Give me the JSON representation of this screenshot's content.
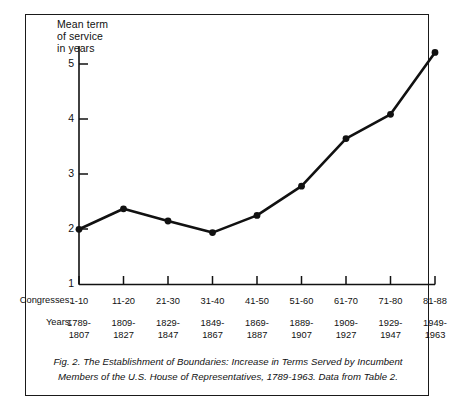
{
  "chart_data": {
    "type": "line",
    "title": "",
    "ylabel": "Mean term\nof service\nin years",
    "xlabel": "",
    "ylim": [
      1,
      5.6
    ],
    "yticks": [
      1,
      2,
      3,
      4,
      5
    ],
    "ytick_labels": [
      "1",
      "2",
      "3",
      "4",
      "5"
    ],
    "grid": false,
    "legend": null,
    "categories": [
      "1-10",
      "11-20",
      "21-30",
      "31-40",
      "41-50",
      "51-60",
      "61-70",
      "71-80",
      "81-88"
    ],
    "x": [
      "1-10",
      "11-20",
      "21-30",
      "31-40",
      "41-50",
      "51-60",
      "61-70",
      "71-80",
      "81-88"
    ],
    "values": [
      2.0,
      2.37,
      2.15,
      1.94,
      2.25,
      2.78,
      3.64,
      4.08,
      5.2
    ],
    "series": [
      {
        "name": "Mean term of service",
        "values": [
          2.0,
          2.37,
          2.15,
          1.94,
          2.25,
          2.78,
          3.64,
          4.08,
          5.2
        ]
      }
    ],
    "marker": "filled-circle",
    "line_color": "#111111"
  },
  "axis": {
    "y_label_text": "Mean term\nof service\nin years",
    "y_ticks": [
      "5",
      "4",
      "3",
      "2",
      "1"
    ]
  },
  "xtable": {
    "row1_header": "Congresses:",
    "row2_header": "Years:",
    "congresses": [
      "1-10",
      "11-20",
      "21-30",
      "31-40",
      "41-50",
      "51-60",
      "61-70",
      "71-80",
      "81-88"
    ],
    "years": [
      "1789-\n1807",
      "1809-\n1827",
      "1829-\n1847",
      "1849-\n1867",
      "1869-\n1887",
      "1889-\n1907",
      "1909-\n1927",
      "1929-\n1947",
      "1949-\n1963"
    ]
  },
  "caption": {
    "text": "Fig. 2. The Establishment of Boundaries: Increase in Terms Served by Incumbent Members of the U.S. House of Representatives, 1789-1963. Data from Table 2."
  }
}
